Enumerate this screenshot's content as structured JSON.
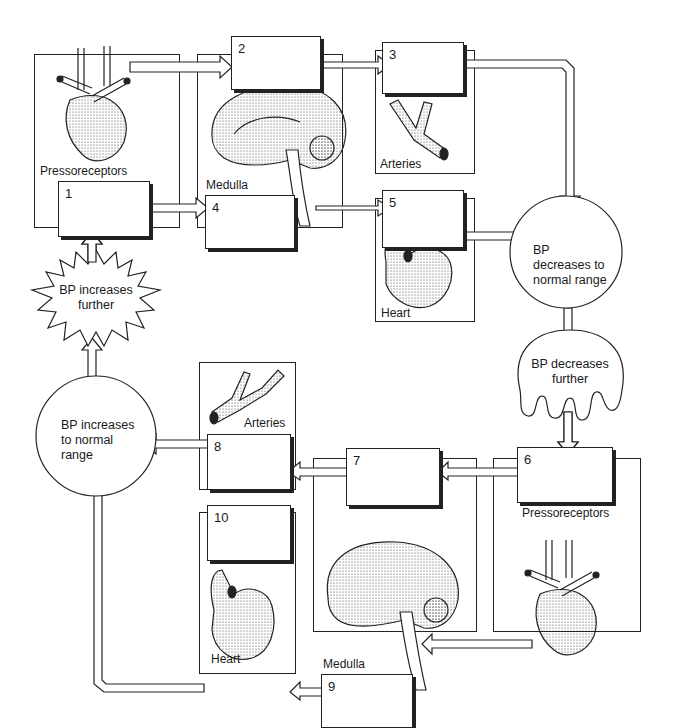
{
  "diagram": {
    "upper_loop": {
      "stimulus": "BP increases further",
      "result": "BP decreases to normal range",
      "boxes": [
        {
          "number": "1",
          "organ_label": "Pressoreceptors"
        },
        {
          "number": "2",
          "organ_label": "Medulla"
        },
        {
          "number": "3",
          "organ_label": "Arteries"
        },
        {
          "number": "4",
          "organ_label": "Medulla"
        },
        {
          "number": "5",
          "organ_label": "Heart"
        }
      ]
    },
    "lower_loop": {
      "stimulus": "BP decreases further",
      "result": "BP increases to normal range",
      "boxes": [
        {
          "number": "6",
          "organ_label": "Pressoreceptors"
        },
        {
          "number": "7",
          "organ_label": "Medulla"
        },
        {
          "number": "8",
          "organ_label": "Arteries"
        },
        {
          "number": "9",
          "organ_label": "Medulla"
        },
        {
          "number": "10",
          "organ_label": "Heart"
        }
      ]
    },
    "labels": {
      "pressoreceptors_top": "Pressoreceptors",
      "medulla_top": "Medulla",
      "arteries_top": "Arteries",
      "heart_top": "Heart",
      "pressoreceptors_bottom": "Pressoreceptors",
      "medulla_bottom": "Medulla",
      "arteries_bottom": "Arteries",
      "heart_bottom": "Heart"
    },
    "bubbles": {
      "bp_increases_further": "BP increases further",
      "bp_decreases_normal": "BP decreases to normal range",
      "bp_decreases_further": "BP decreases further",
      "bp_increases_normal": "BP increases to normal range"
    },
    "colors": {
      "line": "#222222",
      "background": "#ffffff"
    }
  }
}
